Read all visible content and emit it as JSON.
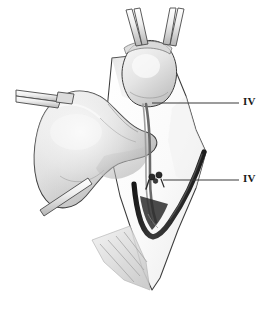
{
  "figure": {
    "background_color": "#ffffff",
    "width": 270,
    "height": 309
  },
  "palette": {
    "outline": "#3a3a3a",
    "vessel_dark": "#262626",
    "tissue_light": "#f0f0f0",
    "tissue_mid": "#cfcfcf",
    "tissue_shadow": "#9a9a9a",
    "instrument_metal": "#e6e6e6",
    "instrument_edge": "#4a4a4a",
    "flap_fill": "#fbfbfb",
    "muscle_fiber": "#c8c8c8",
    "label_color": "#1a1a1a",
    "leader_line_color": "#3a3a3a"
  },
  "labels": [
    {
      "id": "label-iv-superior",
      "text": "IV",
      "description": "Roman numeral four marking superior parathyroid structure",
      "leader_start_x": 152,
      "leader_start_y": 103,
      "leader_end_x": 239,
      "leader_end_y": 103
    },
    {
      "id": "label-iv-inferior",
      "text": "IV",
      "description": "Roman numeral four marking ligated inferior vessel",
      "leader_start_x": 163,
      "leader_start_y": 180,
      "leader_end_x": 239,
      "leader_end_y": 180
    }
  ],
  "structures": [
    {
      "id": "thyroid-lobe",
      "name": "Thyroid lobe",
      "shading": "gradient-light-to-mid"
    },
    {
      "id": "superior-nodule",
      "name": "Superior gland nodule",
      "shading": "gradient-light"
    },
    {
      "id": "tissue-flap",
      "name": "Retracted tissue flap",
      "shading": "near-white"
    },
    {
      "id": "dark-vessel",
      "name": "Dark vessel loop",
      "shading": "near-black"
    },
    {
      "id": "vessel-strand",
      "name": "Thin vessel strand",
      "shading": "mid-gray"
    },
    {
      "id": "muscle-fibers",
      "name": "Muscle fiber bundle",
      "shading": "striped-gray"
    }
  ],
  "instruments": [
    {
      "id": "forceps-top-right",
      "name": "Upper right forceps arm"
    },
    {
      "id": "forceps-top-left",
      "name": "Upper left forceps arm"
    },
    {
      "id": "clamp-left",
      "name": "Left tissue clamp"
    },
    {
      "id": "probe-lower-left",
      "name": "Lower left probe"
    },
    {
      "id": "ligature-clip",
      "name": "Ligature clip / suture knot"
    }
  ]
}
